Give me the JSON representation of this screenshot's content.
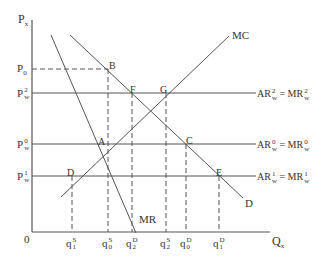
{
  "axes": {
    "y_label": "P",
    "y_label_sub": "x",
    "x_label": "Q",
    "x_label_sub": "x",
    "origin": "0"
  },
  "price_levels": [
    {
      "id": "P0",
      "base": "P",
      "sup": "",
      "sub": "0"
    },
    {
      "id": "Pw2",
      "base": "P",
      "sup": "2",
      "sub": "w"
    },
    {
      "id": "Pw0",
      "base": "P",
      "sup": "0",
      "sub": "w"
    },
    {
      "id": "Pw1",
      "base": "P",
      "sup": "1",
      "sub": "w"
    }
  ],
  "quantities": [
    {
      "id": "q1S",
      "base": "q",
      "sub": "1",
      "sup": "S"
    },
    {
      "id": "q0S",
      "base": "q",
      "sub": "0",
      "sup": "S"
    },
    {
      "id": "q2D",
      "base": "q",
      "sub": "2",
      "sup": "D"
    },
    {
      "id": "q2S",
      "base": "q",
      "sub": "2",
      "sup": "S"
    },
    {
      "id": "q0D",
      "base": "q",
      "sub": "0",
      "sup": "D"
    },
    {
      "id": "q1D",
      "base": "q",
      "sub": "1",
      "sup": "D"
    }
  ],
  "curves": {
    "mc": "MC",
    "mr": "MR",
    "d": "D"
  },
  "world_price_lines": [
    {
      "left": "AR",
      "left_sup": "2",
      "left_sub": "w",
      "eq": "=",
      "right": "MR",
      "right_sup": "2",
      "right_sub": "w"
    },
    {
      "left": "AR",
      "left_sup": "0",
      "left_sub": "w",
      "eq": "=",
      "right": "MR",
      "right_sup": "0",
      "right_sub": "w"
    },
    {
      "left": "AR",
      "left_sup": "1",
      "left_sub": "w",
      "eq": "=",
      "right": "MR",
      "right_sup": "1",
      "right_sub": "w"
    }
  ],
  "points": {
    "A": "A",
    "B": "B",
    "C": "C",
    "D": "D",
    "E": "E",
    "F": "F",
    "G": "G"
  }
}
